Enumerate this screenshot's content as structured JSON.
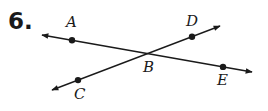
{
  "problem": {
    "number": "6."
  },
  "diagram": {
    "lines": [
      {
        "name": "line-AE",
        "through": [
          "A",
          "B",
          "E"
        ],
        "start": [
          42,
          35
        ],
        "end": [
          252,
          72
        ]
      },
      {
        "name": "line-CD",
        "through": [
          "C",
          "B",
          "D"
        ],
        "start": [
          52,
          90
        ],
        "end": [
          220,
          26
        ]
      }
    ],
    "points": [
      {
        "label": "A",
        "x": 72,
        "y": 40.3,
        "label_x": 66,
        "label_y": 27
      },
      {
        "label": "B",
        "x": 147,
        "y": 53.5,
        "label_x": 143,
        "label_y": 72
      },
      {
        "label": "C",
        "x": 78,
        "y": 80.1,
        "label_x": 74,
        "label_y": 99
      },
      {
        "label": "D",
        "x": 192,
        "y": 36.7,
        "label_x": 186,
        "label_y": 26
      },
      {
        "label": "E",
        "x": 223,
        "y": 66.9,
        "label_x": 217,
        "label_y": 85
      }
    ],
    "stroke_color": "#1a1a1a"
  }
}
